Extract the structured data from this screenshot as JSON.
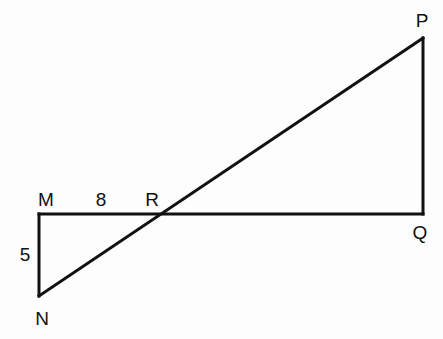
{
  "diagram": {
    "points": {
      "M": {
        "label": "M",
        "x": 39,
        "y": 214
      },
      "N": {
        "label": "N",
        "x": 39,
        "y": 296
      },
      "R": {
        "label": "R",
        "x": 162,
        "y": 214
      },
      "Q": {
        "label": "Q",
        "x": 423,
        "y": 214
      },
      "P": {
        "label": "P",
        "x": 423,
        "y": 38
      }
    },
    "segments": [
      {
        "from": "M",
        "to": "Q"
      },
      {
        "from": "M",
        "to": "N"
      },
      {
        "from": "N",
        "to": "P"
      },
      {
        "from": "Q",
        "to": "P"
      }
    ],
    "measurements": {
      "MR": "8",
      "MN": "5"
    },
    "stroke_color": "#111111"
  }
}
